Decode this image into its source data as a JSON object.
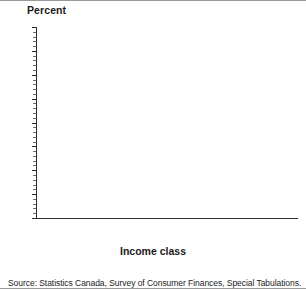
{
  "chart_data": {
    "type": "bar",
    "title": "",
    "ylabel": "Percent",
    "xlabel": "Income class",
    "ylim": [
      0,
      80
    ],
    "ytick_step": 10,
    "yticks": [
      0,
      10,
      20,
      30,
      40,
      50,
      60,
      70,
      80
    ],
    "grid": false,
    "legend_position": "bottom",
    "categories": [
      "Poor",
      "Vulnerable",
      "Other mainstream",
      "Advantaged",
      "Affluent"
    ],
    "series": [
      {
        "name": "1973",
        "color": "#bdbdbd",
        "values": [
          12.4,
          5.9,
          66.3,
          10.1,
          5.4
        ],
        "labels": [
          "12.4%",
          "5.9%",
          "66.3%",
          "10.1%",
          "5.4%"
        ]
      },
      {
        "name": "1987",
        "color": "#8c8c8c",
        "values": [
          11.9,
          5.4,
          63.0,
          12.9,
          6.8
        ],
        "labels": [
          "11.9%",
          "5.4%",
          "63.0%",
          "12.9%",
          "6.8%"
        ]
      }
    ]
  },
  "axis": {
    "y_title": "Percent",
    "x_title": "Income class",
    "y_tick_labels": [
      "80",
      "70",
      "60",
      "50",
      "40",
      "30",
      "20",
      "10",
      "0"
    ]
  },
  "categories": [
    {
      "line1": "Poor",
      "line2": ""
    },
    {
      "line1": "Vulnerable",
      "line2": ""
    },
    {
      "line1": "Other",
      "line2": "mainstream"
    },
    {
      "line1": "Advantaged",
      "line2": ""
    },
    {
      "line1": "Affluent",
      "line2": ""
    }
  ],
  "legend": [
    {
      "label": "1973",
      "color": "#bdbdbd"
    },
    {
      "label": "1987",
      "color": "#8c8c8c"
    }
  ],
  "source": {
    "text": "Source: Statistics Canada, Survey of Consumer Finances, Special Tabulations."
  }
}
